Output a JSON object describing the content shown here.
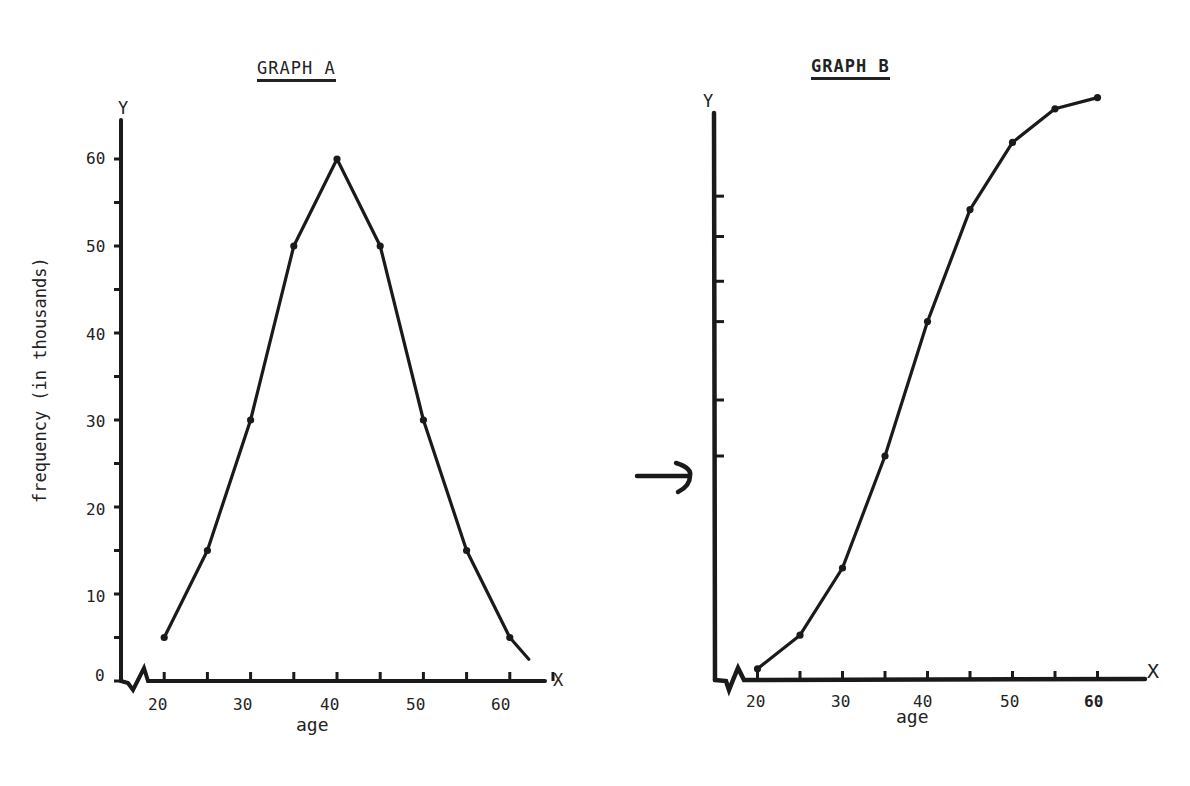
{
  "graph_a": {
    "title": "GRAPH A",
    "y_axis_letter": "Y",
    "x_axis_letter": "X",
    "ylabel": "frequency (in thousands)",
    "xlabel": "age",
    "y_tick_labels": [
      "0",
      "10",
      "20",
      "30",
      "40",
      "50",
      "60"
    ],
    "x_tick_labels": [
      "20",
      "30",
      "40",
      "50",
      "60"
    ]
  },
  "graph_b": {
    "title": "GRAPH B",
    "y_axis_letter": "Y",
    "x_axis_letter": "X",
    "xlabel": "age",
    "x_tick_labels": [
      "20",
      "30",
      "40",
      "50",
      "60"
    ],
    "arrow_marker": "arrow pointing at y-axis at cumulative value of age 35"
  },
  "colors": {
    "ink": "#1a1a1a",
    "background": "#ffffff"
  },
  "chart_data": [
    {
      "type": "line",
      "title": "GRAPH A",
      "xlabel": "age",
      "ylabel": "frequency (in thousands)",
      "x": [
        20,
        25,
        30,
        35,
        40,
        45,
        50,
        55,
        60
      ],
      "values": [
        5,
        15,
        30,
        50,
        60,
        50,
        30,
        15,
        5
      ],
      "xlim": [
        15,
        65
      ],
      "ylim": [
        0,
        65
      ],
      "y_ticks": [
        0,
        5,
        10,
        15,
        20,
        25,
        30,
        35,
        40,
        45,
        50,
        55,
        60
      ],
      "x_ticks": [
        20,
        25,
        30,
        35,
        40,
        45,
        50,
        55,
        60,
        65
      ],
      "grid": false,
      "legend": null
    },
    {
      "type": "line",
      "title": "GRAPH B",
      "xlabel": "age",
      "ylabel": "",
      "x": [
        20,
        25,
        30,
        35,
        40,
        45,
        50,
        55,
        60
      ],
      "values": [
        5,
        20,
        50,
        100,
        160,
        210,
        240,
        255,
        260
      ],
      "xlim": [
        15,
        65
      ],
      "ylim": [
        0,
        270
      ],
      "y_ticks_unlabeled": [
        100,
        125,
        160,
        178,
        198,
        216
      ],
      "annotation": "arrow at y-axis marking value at age 35",
      "grid": false,
      "legend": null
    }
  ]
}
